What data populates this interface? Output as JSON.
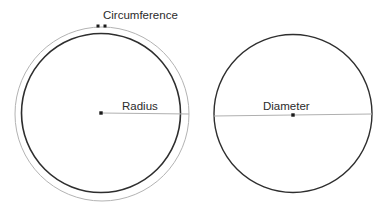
{
  "figure": {
    "title": "",
    "background_color": "#ffffff",
    "width": 390,
    "height": 217
  },
  "colors": {
    "dark_stroke": "#2e2e2e",
    "gray_stroke": "#b3b3b3",
    "leader_line": "#b0b0b0",
    "dot": "#1a1a1a",
    "text": "#2b2b2b"
  },
  "left_figure": {
    "name": "circumference-radius-circle",
    "labels": {
      "circumference": "Circumference",
      "radius": "Radius"
    },
    "outer_circle": {
      "center_x": 102,
      "center_y": 114,
      "radius": 87,
      "stroke": "#b3b3b3",
      "stroke_width": 1
    },
    "inner_circle": {
      "center_x": 101,
      "center_y": 113,
      "radius": 79.5,
      "stroke": "#2e2e2e",
      "stroke_width": 1.6
    },
    "center_dot": {
      "x": 101,
      "y": 113,
      "size": 3.4
    },
    "radius_line": {
      "x1": 101,
      "y1": 113,
      "x2": 189,
      "y2": 114
    },
    "circumference_markers": [
      {
        "x": 98,
        "y": 26,
        "size": 3
      },
      {
        "x": 105,
        "y": 26,
        "size": 3
      }
    ],
    "circumference_label_pos": {
      "x": 103,
      "y": 19
    },
    "radius_label_pos": {
      "x": 122,
      "y": 110
    }
  },
  "right_figure": {
    "name": "diameter-circle",
    "labels": {
      "diameter": "Diameter"
    },
    "circle": {
      "center_x": 293,
      "center_y": 113.5,
      "radius": 79,
      "stroke": "#2e2e2e",
      "stroke_width": 1.4
    },
    "center_dot": {
      "x": 293,
      "y": 115,
      "size": 3.4
    },
    "diameter_line": {
      "x1": 214,
      "y1": 116,
      "x2": 372,
      "y2": 114
    },
    "diameter_label_pos": {
      "x": 263,
      "y": 110
    }
  }
}
